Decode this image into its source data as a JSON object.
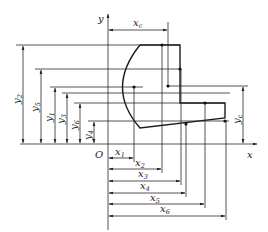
{
  "diagram": {
    "axes": {
      "x_label": "x",
      "y_label": "y",
      "origin_label": "O"
    },
    "centroid_x_label": {
      "base": "x",
      "sub": "c"
    },
    "centroid_y_label": {
      "base": "y",
      "sub": "c"
    },
    "x_dimensions": [
      {
        "base": "x",
        "sub": "1"
      },
      {
        "base": "x",
        "sub": "2"
      },
      {
        "base": "x",
        "sub": "3"
      },
      {
        "base": "x",
        "sub": "4"
      },
      {
        "base": "x",
        "sub": "5"
      },
      {
        "base": "x",
        "sub": "6"
      }
    ],
    "y_dimensions": [
      {
        "base": "y",
        "sub": "2"
      },
      {
        "base": "y",
        "sub": "5"
      },
      {
        "base": "y",
        "sub": "1"
      },
      {
        "base": "y",
        "sub": "3"
      },
      {
        "base": "y",
        "sub": "6"
      },
      {
        "base": "y",
        "sub": "4"
      }
    ]
  }
}
